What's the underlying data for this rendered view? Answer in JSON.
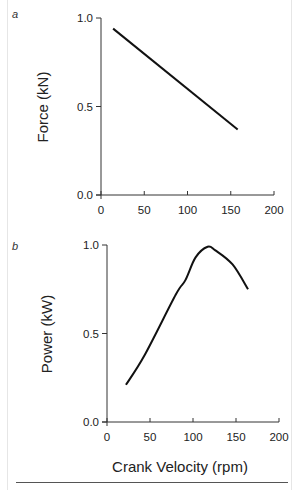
{
  "figure": {
    "panels": [
      {
        "letter": "a",
        "ylabel": "Force (kN)",
        "yticks": [
          "0.0",
          "0.5",
          "1.0"
        ],
        "xticks": [
          "0",
          "50",
          "100",
          "150",
          "200"
        ]
      },
      {
        "letter": "b",
        "ylabel": "Power (kW)",
        "yticks": [
          "0.0",
          "0.5",
          "1.0"
        ],
        "xticks": [
          "0",
          "50",
          "100",
          "150",
          "200"
        ],
        "xlabel": "Crank Velocity (rpm)"
      }
    ],
    "line_color": "#111111"
  },
  "chart_data": [
    {
      "type": "line",
      "panel": "a",
      "title": "",
      "xlabel": "",
      "ylabel": "Force (kN)",
      "xlim": [
        0,
        200
      ],
      "ylim": [
        0.0,
        1.0
      ],
      "xticks": [
        0,
        50,
        100,
        150,
        200
      ],
      "yticks": [
        0.0,
        0.5,
        1.0
      ],
      "grid": false,
      "series": [
        {
          "name": "Force",
          "x": [
            14,
            158
          ],
          "y": [
            0.94,
            0.37
          ]
        }
      ]
    },
    {
      "type": "line",
      "panel": "b",
      "title": "",
      "xlabel": "Crank Velocity (rpm)",
      "ylabel": "Power (kW)",
      "xlim": [
        0,
        200
      ],
      "ylim": [
        0.0,
        1.0
      ],
      "xticks": [
        0,
        50,
        100,
        150,
        200
      ],
      "yticks": [
        0.0,
        0.5,
        1.0
      ],
      "grid": false,
      "series": [
        {
          "name": "Power",
          "x": [
            22,
            44,
            80,
            91,
            103,
            117,
            126,
            146,
            164
          ],
          "y": [
            0.21,
            0.38,
            0.72,
            0.8,
            0.93,
            0.99,
            0.97,
            0.89,
            0.75
          ]
        }
      ]
    }
  ]
}
